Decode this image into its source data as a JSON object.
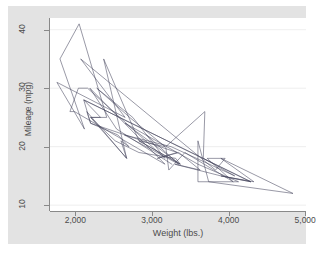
{
  "figure": {
    "background_color": "#ffffff",
    "graph_region_color": "#e3e3e3",
    "plot_region_color": "#ffffff",
    "axis_color": "#898989",
    "grid_color": "#eaeaea",
    "line_color": "#44445c"
  },
  "axes": {
    "y_title": "Mileage (mpg)",
    "x_title": "Weight (lbs.)",
    "y_ticks": [
      {
        "value": 10,
        "label": "10"
      },
      {
        "value": 20,
        "label": "20"
      },
      {
        "value": 30,
        "label": "30"
      },
      {
        "value": 40,
        "label": "40"
      }
    ],
    "x_ticks": [
      {
        "value": 2000,
        "label": "2,000"
      },
      {
        "value": 3000,
        "label": "3,000"
      },
      {
        "value": 4000,
        "label": "4,000"
      },
      {
        "value": 5000,
        "label": "5,000"
      }
    ]
  },
  "chart_data": {
    "type": "line",
    "title": "",
    "subtitle": "",
    "xlabel": "Weight (lbs.)",
    "ylabel": "Mileage (mpg)",
    "xlim": [
      1670,
      5010
    ],
    "ylim": [
      9.0,
      42.0
    ],
    "grid": true,
    "grid_axis": "y",
    "legend": "none",
    "series": [
      {
        "name": "Mileage (mpg) vs Weight (lbs.)",
        "x": [
          2930,
          3350,
          2640,
          3250,
          4080,
          3670,
          3690,
          3180,
          3220,
          3430,
          4060,
          3600,
          3600,
          3740,
          4840,
          3900,
          4330,
          3900,
          4290,
          2110,
          2200,
          2150,
          2670,
          2595,
          2700,
          2556,
          2200,
          3330,
          3070,
          3350,
          3630,
          3300,
          3900,
          4290,
          2110,
          2330,
          2200,
          2520,
          2830,
          3310,
          3370,
          2830,
          3370,
          2650,
          3600,
          4130,
          4060,
          3720,
          3955,
          3830,
          2070,
          2650,
          1760,
          2120,
          1800,
          2050,
          2410,
          2200,
          2670,
          2370,
          2830,
          3170,
          2710,
          2280,
          2750,
          3170,
          2160,
          2040,
          1930,
          1990,
          3170,
          2190,
          2540,
          3260
        ],
        "y": [
          22,
          17,
          22,
          20,
          15,
          18,
          26,
          20,
          16,
          19,
          14,
          14,
          21,
          14,
          12,
          18,
          14,
          15,
          14,
          28,
          24,
          26,
          18,
          21,
          20,
          22,
          24,
          19,
          18,
          19,
          16,
          17,
          15,
          14,
          28,
          25,
          25,
          21,
          19,
          18,
          17,
          21,
          17,
          24,
          17,
          14,
          14,
          18,
          18,
          16,
          35,
          25,
          31,
          23,
          35,
          41,
          25,
          25,
          18,
          35,
          21,
          20,
          25,
          30,
          25,
          18,
          30,
          30,
          26,
          26,
          17,
          30,
          23,
          17
        ]
      }
    ]
  }
}
